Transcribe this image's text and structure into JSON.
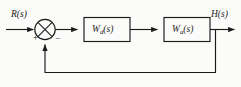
{
  "figure": {
    "type": "control-system-block-diagram",
    "background_color": "#fbfbf9",
    "line_color": "#1b1b1b",
    "text_color": "#1b1b1b"
  },
  "input": {
    "label": "R(s)",
    "variable": "R",
    "argument": "s"
  },
  "output": {
    "label": "H(s)",
    "variable": "H",
    "argument": "s"
  },
  "summing_junction": {
    "name": "summing-junction",
    "style": "circle-with-cross",
    "input_sign": "+",
    "feedback_sign": "−"
  },
  "blocks": [
    {
      "id": "block-wd",
      "label": "Wd(s)",
      "base": "W",
      "subscript": "d",
      "argument": "(s)"
    },
    {
      "id": "block-wa",
      "label": "Wa(s)",
      "base": "W",
      "subscript": "a",
      "argument": "(s)"
    }
  ],
  "connections": [
    {
      "name": "input-to-summer",
      "from": "R(s)",
      "to": "summing-junction",
      "arrow": true
    },
    {
      "name": "summer-to-block-wd",
      "from": "summing-junction",
      "to": "Wd(s)",
      "arrow": true
    },
    {
      "name": "block-wd-to-block-wa",
      "from": "Wd(s)",
      "to": "Wa(s)",
      "arrow": true
    },
    {
      "name": "block-wa-to-output",
      "from": "Wa(s)",
      "to": "H(s)",
      "arrow": true
    },
    {
      "name": "feedback-path",
      "from": "output-tap",
      "to": "summing-junction",
      "arrow": true
    }
  ]
}
